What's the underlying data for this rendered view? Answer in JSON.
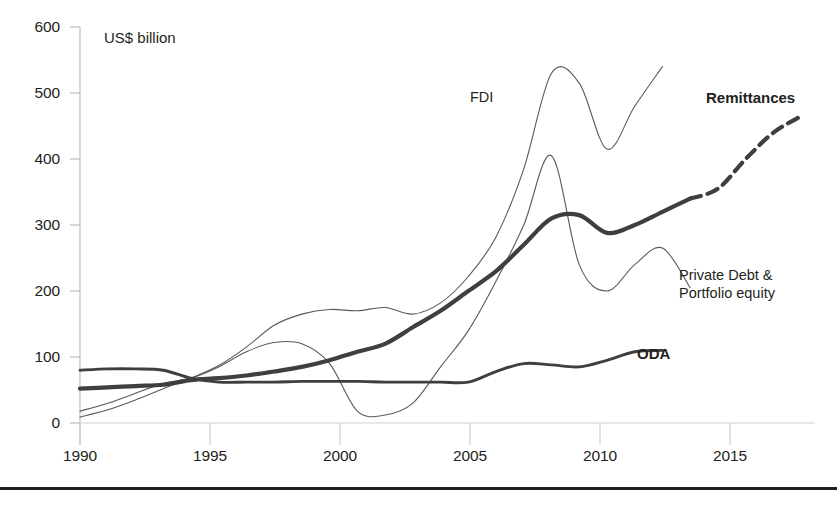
{
  "chart_data": {
    "type": "line",
    "title": "",
    "unit_note": "US$ billion",
    "xlabel": "",
    "ylabel": "",
    "xlim": [
      1990,
      2016.5
    ],
    "ylim": [
      0,
      600
    ],
    "grid": false,
    "legend_position": "inline-labels",
    "x_ticks": [
      "1990",
      "1995",
      "2000",
      "2005",
      "2010",
      "2015"
    ],
    "x_tick_values": [
      1990,
      1995,
      2000,
      2005,
      2010,
      2015
    ],
    "y_ticks": [
      "0",
      "100",
      "200",
      "300",
      "400",
      "500",
      "600"
    ],
    "y_tick_values": [
      0,
      100,
      200,
      300,
      400,
      500,
      600
    ],
    "series": [
      {
        "name": "FDI",
        "label": "FDI",
        "label_bold": false,
        "style": "thin-solid",
        "color": "#595959",
        "x": [
          1990,
          1991,
          1992,
          1993,
          1994,
          1995,
          1996,
          1997,
          1998,
          1999,
          2000,
          2001,
          2002,
          2003,
          2004,
          2005,
          2006,
          2007,
          2008,
          2009,
          2010,
          2011
        ],
        "values": [
          9,
          20,
          35,
          52,
          68,
          87,
          115,
          148,
          165,
          172,
          170,
          175,
          165,
          182,
          222,
          282,
          385,
          530,
          515,
          415,
          480,
          540
        ]
      },
      {
        "name": "Private Debt & Portfolio equity",
        "label": "Private Debt &\nPortfolio equity",
        "label_line1": "Private Debt &",
        "label_line2": "Portfolio equity",
        "label_bold": false,
        "style": "thin-solid",
        "color": "#595959",
        "x": [
          1990,
          1991,
          1992,
          1993,
          1994,
          1995,
          1996,
          1997,
          1998,
          1999,
          2000,
          2001,
          2002,
          2003,
          2004,
          2005,
          2006,
          2007,
          2008,
          2009,
          2010,
          2011,
          2012
        ],
        "values": [
          18,
          30,
          45,
          60,
          68,
          85,
          108,
          122,
          120,
          90,
          18,
          12,
          30,
          85,
          140,
          215,
          300,
          405,
          240,
          200,
          240,
          265,
          205
        ]
      },
      {
        "name": "Remittances",
        "label": "Remittances",
        "label_bold": true,
        "style": "thick-solid-with-dashed-projection",
        "color": "#3f3f3f",
        "solid_x": [
          1990,
          1991,
          1992,
          1993,
          1994,
          1995,
          1996,
          1997,
          1998,
          1999,
          2000,
          2001,
          2002,
          2003,
          2004,
          2005,
          2006,
          2007,
          2008,
          2009,
          2010,
          2011,
          2012
        ],
        "solid_values": [
          52,
          54,
          56,
          58,
          65,
          68,
          72,
          78,
          85,
          95,
          108,
          120,
          145,
          170,
          200,
          230,
          270,
          310,
          315,
          288,
          300,
          320,
          340
        ],
        "dashed_x": [
          2012,
          2013,
          2014,
          2015,
          2016
        ],
        "dashed_values": [
          340,
          355,
          400,
          440,
          465
        ]
      },
      {
        "name": "ODA",
        "label": "ODA",
        "label_bold": true,
        "style": "medium-solid",
        "color": "#3f3f3f",
        "x": [
          1990,
          1991,
          1992,
          1993,
          1994,
          1995,
          1996,
          1997,
          1998,
          1999,
          2000,
          2001,
          2002,
          2003,
          2004,
          2005,
          2006,
          2007,
          2008,
          2009,
          2010,
          2011
        ],
        "values": [
          80,
          82,
          82,
          80,
          68,
          62,
          62,
          62,
          63,
          63,
          63,
          62,
          62,
          62,
          62,
          78,
          90,
          88,
          85,
          95,
          108,
          110
        ]
      }
    ],
    "annotations": [
      {
        "text": "US$ billion",
        "type": "unit-note"
      }
    ]
  },
  "labels": {
    "fdi": "FDI",
    "remittances": "Remittances",
    "private_debt_line1": "Private Debt &",
    "private_debt_line2": "Portfolio equity",
    "oda": "ODA",
    "unit_note": "US$ billion"
  },
  "colors": {
    "thin_line": "#595959",
    "thick_line": "#3f3f3f",
    "axis": "#bfbfbf",
    "text": "#231f20",
    "rule": "#231f20"
  }
}
